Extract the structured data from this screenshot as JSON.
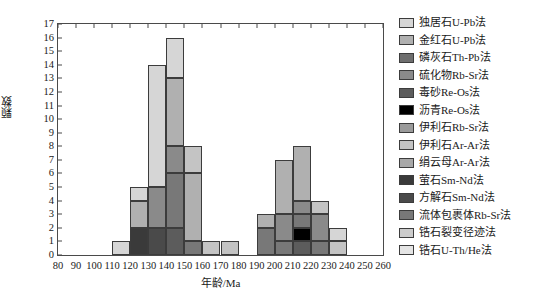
{
  "chart_data": {
    "type": "bar",
    "subtype": "stacked-histogram",
    "title": "",
    "xlabel": "年龄/Ma",
    "ylabel": "颗数",
    "xlim": [
      80,
      260
    ],
    "ylim": [
      0,
      17
    ],
    "bin_width": 10,
    "xticks": [
      80,
      90,
      100,
      110,
      120,
      130,
      140,
      150,
      160,
      170,
      180,
      190,
      200,
      210,
      220,
      230,
      240,
      250,
      260
    ],
    "yticks": [
      0,
      1,
      2,
      3,
      4,
      5,
      6,
      7,
      8,
      9,
      10,
      11,
      12,
      13,
      14,
      15,
      16,
      17
    ],
    "grid": false,
    "legend_position": "right",
    "categories": [
      "110-120",
      "120-130",
      "130-140",
      "140-150",
      "150-160",
      "160-170",
      "170-180",
      "190-200",
      "200-210",
      "210-220",
      "220-230",
      "230-240"
    ],
    "bin_starts": [
      110,
      120,
      130,
      140,
      150,
      160,
      170,
      190,
      200,
      210,
      220,
      230
    ],
    "totals": [
      1,
      5,
      14,
      16,
      8,
      1,
      1,
      3,
      7,
      8,
      4,
      2
    ],
    "series": [
      {
        "name": "独居石U-Pb法",
        "color": "#d6d6d6",
        "values": [
          1,
          1,
          9,
          3,
          0,
          0,
          0,
          0,
          0,
          0,
          0,
          1
        ]
      },
      {
        "name": "金红石U-Pb法",
        "color": "#b0b0b0",
        "values": [
          0,
          2,
          0,
          5,
          5,
          0,
          0,
          1,
          4,
          4,
          0,
          0
        ]
      },
      {
        "name": "磷灰石Th-Pb法",
        "color": "#6e6e6e",
        "values": [
          0,
          0,
          0,
          0,
          0,
          0,
          0,
          0,
          0,
          0,
          0,
          0
        ]
      },
      {
        "name": "硫化物Rb-Sr法",
        "color": "#8a8a8a",
        "values": [
          0,
          0,
          3,
          2,
          0,
          0,
          0,
          0,
          2,
          1,
          2,
          0
        ]
      },
      {
        "name": "毒砂Re-Os法",
        "color": "#5c5c5c",
        "values": [
          0,
          0,
          0,
          2,
          0,
          0,
          0,
          0,
          0,
          1,
          0,
          0
        ]
      },
      {
        "name": "沥青Re-Os法",
        "color": "#000000",
        "values": [
          0,
          0,
          0,
          0,
          0,
          0,
          0,
          0,
          0,
          1,
          0,
          0
        ]
      },
      {
        "name": "伊利石Rb-Sr法",
        "color": "#9a9a9a",
        "values": [
          0,
          0,
          0,
          0,
          0,
          0,
          0,
          0,
          0,
          0,
          0,
          0
        ]
      },
      {
        "name": "伊利石Ar-Ar法",
        "color": "#c4c4c4",
        "values": [
          0,
          0,
          0,
          0,
          2,
          1,
          1,
          0,
          0,
          0,
          1,
          1
        ]
      },
      {
        "name": "绢云母Ar-Ar法",
        "color": "#a8a8a8",
        "values": [
          0,
          0,
          0,
          0,
          0,
          0,
          0,
          0,
          0,
          0,
          0,
          0
        ]
      },
      {
        "name": "萤石Sm-Nd法",
        "color": "#3a3a3a",
        "values": [
          0,
          2,
          0,
          0,
          0,
          0,
          0,
          0,
          0,
          0,
          0,
          0
        ]
      },
      {
        "name": "方解石Sm-Nd法",
        "color": "#4a4a4a",
        "values": [
          0,
          0,
          2,
          0,
          0,
          0,
          0,
          0,
          0,
          0,
          0,
          0
        ]
      },
      {
        "name": "流体包裹体Rb-Sr法",
        "color": "#787878",
        "values": [
          0,
          0,
          0,
          4,
          1,
          0,
          0,
          2,
          1,
          1,
          1,
          0
        ]
      },
      {
        "name": "锆石裂变径迹法",
        "color": "#cccccc",
        "values": [
          0,
          0,
          0,
          0,
          0,
          0,
          0,
          0,
          0,
          0,
          0,
          0
        ]
      },
      {
        "name": "锆石U-Th/He法",
        "color": "#e4e4e4",
        "values": [
          0,
          0,
          0,
          0,
          0,
          0,
          0,
          0,
          0,
          0,
          0,
          0
        ]
      }
    ],
    "stacks": [
      {
        "bin": 110,
        "segments": [
          {
            "name": "独居石U-Pb法",
            "color": "#d6d6d6",
            "value": 1
          }
        ]
      },
      {
        "bin": 120,
        "segments": [
          {
            "name": "萤石Sm-Nd法",
            "color": "#3a3a3a",
            "value": 2
          },
          {
            "name": "金红石U-Pb法",
            "color": "#b0b0b0",
            "value": 2
          },
          {
            "name": "独居石U-Pb法",
            "color": "#d6d6d6",
            "value": 1
          }
        ]
      },
      {
        "bin": 130,
        "segments": [
          {
            "name": "方解石Sm-Nd法",
            "color": "#4a4a4a",
            "value": 2
          },
          {
            "name": "硫化物Rb-Sr法",
            "color": "#8a8a8a",
            "value": 3
          },
          {
            "name": "独居石U-Pb法",
            "color": "#d6d6d6",
            "value": 9
          }
        ]
      },
      {
        "bin": 140,
        "segments": [
          {
            "name": "毒砂Re-Os法",
            "color": "#5c5c5c",
            "value": 2
          },
          {
            "name": "流体包裹体Rb-Sr法",
            "color": "#787878",
            "value": 4
          },
          {
            "name": "硫化物Rb-Sr法",
            "color": "#8a8a8a",
            "value": 2
          },
          {
            "name": "金红石U-Pb法",
            "color": "#b0b0b0",
            "value": 5
          },
          {
            "name": "独居石U-Pb法",
            "color": "#d6d6d6",
            "value": 3
          }
        ]
      },
      {
        "bin": 150,
        "segments": [
          {
            "name": "流体包裹体Rb-Sr法",
            "color": "#787878",
            "value": 1
          },
          {
            "name": "金红石U-Pb法",
            "color": "#b0b0b0",
            "value": 5
          },
          {
            "name": "伊利石Ar-Ar法",
            "color": "#c4c4c4",
            "value": 2
          }
        ]
      },
      {
        "bin": 160,
        "segments": [
          {
            "name": "伊利石Ar-Ar法",
            "color": "#c4c4c4",
            "value": 1
          }
        ]
      },
      {
        "bin": 170,
        "segments": [
          {
            "name": "伊利石Ar-Ar法",
            "color": "#c4c4c4",
            "value": 1
          }
        ]
      },
      {
        "bin": 190,
        "segments": [
          {
            "name": "流体包裹体Rb-Sr法",
            "color": "#787878",
            "value": 2
          },
          {
            "name": "金红石U-Pb法",
            "color": "#b0b0b0",
            "value": 1
          }
        ]
      },
      {
        "bin": 200,
        "segments": [
          {
            "name": "流体包裹体Rb-Sr法",
            "color": "#787878",
            "value": 1
          },
          {
            "name": "硫化物Rb-Sr法",
            "color": "#8a8a8a",
            "value": 2
          },
          {
            "name": "金红石U-Pb法",
            "color": "#b0b0b0",
            "value": 4
          }
        ]
      },
      {
        "bin": 210,
        "segments": [
          {
            "name": "毒砂Re-Os法",
            "color": "#5c5c5c",
            "value": 1
          },
          {
            "name": "沥青Re-Os法",
            "color": "#000000",
            "value": 1
          },
          {
            "name": "流体包裹体Rb-Sr法",
            "color": "#787878",
            "value": 1
          },
          {
            "name": "硫化物Rb-Sr法",
            "color": "#8a8a8a",
            "value": 1
          },
          {
            "name": "金红石U-Pb法",
            "color": "#b0b0b0",
            "value": 4
          }
        ]
      },
      {
        "bin": 220,
        "segments": [
          {
            "name": "流体包裹体Rb-Sr法",
            "color": "#787878",
            "value": 1
          },
          {
            "name": "硫化物Rb-Sr法",
            "color": "#8a8a8a",
            "value": 2
          },
          {
            "name": "伊利石Ar-Ar法",
            "color": "#c4c4c4",
            "value": 1
          }
        ]
      },
      {
        "bin": 230,
        "segments": [
          {
            "name": "伊利石Ar-Ar法",
            "color": "#c4c4c4",
            "value": 1
          },
          {
            "name": "独居石U-Pb法",
            "color": "#d6d6d6",
            "value": 1
          }
        ]
      }
    ]
  },
  "legend": {
    "items": [
      {
        "label": "独居石U-Pb法",
        "color": "#d6d6d6"
      },
      {
        "label": "金红石U-Pb法",
        "color": "#b0b0b0"
      },
      {
        "label": "磷灰石Th-Pb法",
        "color": "#6e6e6e"
      },
      {
        "label": "硫化物Rb-Sr法",
        "color": "#8a8a8a"
      },
      {
        "label": "毒砂Re-Os法",
        "color": "#5c5c5c"
      },
      {
        "label": "沥青Re-Os法",
        "color": "#000000"
      },
      {
        "label": "伊利石Rb-Sr法",
        "color": "#9a9a9a"
      },
      {
        "label": "伊利石Ar-Ar法",
        "color": "#c4c4c4"
      },
      {
        "label": "绢云母Ar-Ar法",
        "color": "#a8a8a8"
      },
      {
        "label": "萤石Sm-Nd法",
        "color": "#3a3a3a"
      },
      {
        "label": "方解石Sm-Nd法",
        "color": "#4a4a4a"
      },
      {
        "label": "流体包裹体Rb-Sr法",
        "color": "#787878"
      },
      {
        "label": "锆石裂变径迹法",
        "color": "#cccccc"
      },
      {
        "label": "锆石U-Th/He法",
        "color": "#e4e4e4"
      }
    ]
  }
}
